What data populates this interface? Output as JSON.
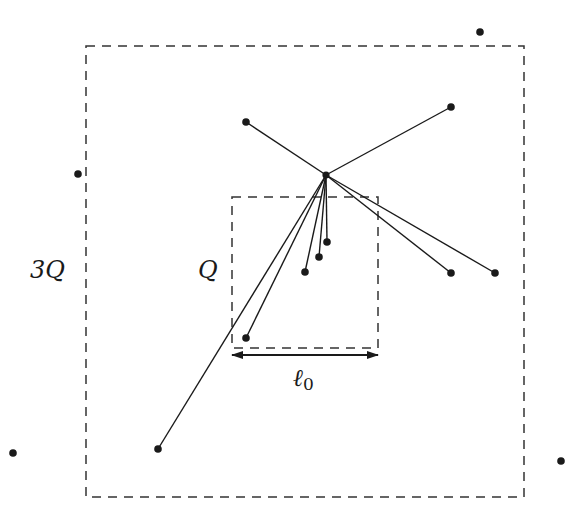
{
  "diagram": {
    "stroke_color": "#1a1a1a",
    "dash_color": "#333333",
    "outer_box": {
      "label": "3Q",
      "x1": 86,
      "y1": 46,
      "x2": 524,
      "y2": 497
    },
    "inner_box": {
      "label": "Q",
      "x1": 232,
      "y1": 197,
      "x2": 378,
      "y2": 348
    },
    "length_marker": {
      "label_main": "ℓ",
      "label_sub": "0",
      "x1": 232,
      "x2": 378,
      "y": 355
    },
    "hub": {
      "x": 326,
      "y": 175
    },
    "connected_points": [
      {
        "x": 246,
        "y": 122
      },
      {
        "x": 451,
        "y": 107
      },
      {
        "x": 158,
        "y": 449
      },
      {
        "x": 246,
        "y": 338
      },
      {
        "x": 305,
        "y": 272
      },
      {
        "x": 319,
        "y": 257
      },
      {
        "x": 327,
        "y": 242
      },
      {
        "x": 451,
        "y": 273
      },
      {
        "x": 495,
        "y": 273
      }
    ],
    "isolated_points": [
      {
        "x": 480,
        "y": 32
      },
      {
        "x": 78,
        "y": 174
      },
      {
        "x": 13,
        "y": 453
      },
      {
        "x": 561,
        "y": 461
      }
    ]
  }
}
